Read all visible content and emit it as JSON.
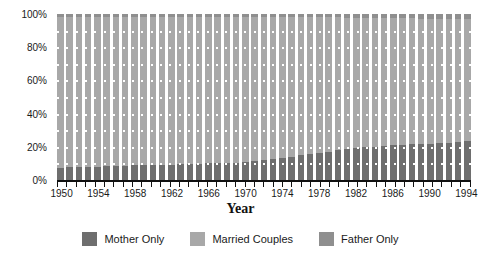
{
  "chart_data": {
    "type": "bar",
    "subtype": "stacked-percentage",
    "title": "",
    "xlabel": "Year",
    "ylabel": "",
    "ylim": [
      0,
      100
    ],
    "ytick_labels": [
      "0%",
      "20%",
      "40%",
      "60%",
      "80%",
      "100%"
    ],
    "ytick_values": [
      0,
      20,
      40,
      60,
      80,
      100
    ],
    "grid": true,
    "grid_style": "white dotted horizontal over bars",
    "legend_position": "bottom-center",
    "categories": [
      1950,
      1951,
      1952,
      1953,
      1954,
      1955,
      1956,
      1957,
      1958,
      1959,
      1960,
      1961,
      1962,
      1963,
      1964,
      1965,
      1966,
      1967,
      1968,
      1969,
      1970,
      1971,
      1972,
      1973,
      1974,
      1975,
      1976,
      1977,
      1978,
      1979,
      1980,
      1981,
      1982,
      1983,
      1984,
      1985,
      1986,
      1987,
      1988,
      1989,
      1990,
      1991,
      1992,
      1993,
      1994
    ],
    "xtick_labels": [
      "1950",
      "1954",
      "1958",
      "1962",
      "1966",
      "1970",
      "1974",
      "1978",
      "1982",
      "1986",
      "1990",
      "1994"
    ],
    "xtick_label_years": [
      1950,
      1954,
      1958,
      1962,
      1966,
      1970,
      1974,
      1978,
      1982,
      1986,
      1990,
      1994
    ],
    "xlim": [
      1950,
      1994
    ],
    "series": [
      {
        "name": "Mother Only",
        "color": "#6e6e6e",
        "values": [
          7.0,
          8.0,
          8.0,
          8.0,
          8.0,
          8.5,
          8.5,
          8.5,
          9.0,
          9.0,
          9.0,
          9.0,
          9.0,
          9.5,
          9.5,
          9.5,
          10.0,
          10.0,
          10.0,
          10.5,
          11.0,
          11.5,
          12.0,
          12.5,
          13.0,
          14.0,
          15.0,
          15.5,
          16.5,
          17.0,
          18.0,
          18.5,
          19.5,
          20.0,
          20.0,
          20.5,
          21.0,
          21.0,
          21.5,
          21.5,
          21.5,
          22.0,
          22.5,
          23.0,
          23.5
        ]
      },
      {
        "name": "Married Couples",
        "color": "#a8a8a8",
        "values": [
          91.0,
          90.0,
          90.0,
          90.0,
          90.0,
          89.5,
          89.5,
          89.5,
          89.0,
          89.0,
          89.0,
          89.0,
          89.0,
          88.5,
          88.5,
          88.5,
          88.0,
          88.0,
          88.0,
          87.5,
          87.0,
          86.5,
          86.0,
          85.5,
          85.0,
          84.0,
          83.0,
          82.5,
          81.5,
          81.0,
          80.0,
          79.0,
          78.0,
          77.5,
          77.5,
          77.0,
          76.5,
          76.5,
          76.0,
          75.5,
          75.5,
          75.0,
          74.5,
          74.0,
          73.5
        ]
      },
      {
        "name": "Father Only",
        "color": "#8f8f8f",
        "values": [
          2.0,
          2.0,
          2.0,
          2.0,
          2.0,
          2.0,
          2.0,
          2.0,
          2.0,
          2.0,
          2.0,
          2.0,
          2.0,
          2.0,
          2.0,
          2.0,
          2.0,
          2.0,
          2.0,
          2.0,
          2.0,
          2.0,
          2.0,
          2.0,
          2.0,
          2.0,
          2.0,
          2.0,
          2.0,
          2.0,
          2.0,
          2.5,
          2.5,
          2.5,
          2.5,
          2.5,
          2.5,
          2.5,
          2.5,
          3.0,
          3.0,
          3.0,
          3.0,
          3.0,
          3.0
        ]
      }
    ]
  },
  "legend": {
    "items": [
      {
        "label": "Mother Only",
        "color": "#6e6e6e"
      },
      {
        "label": "Married Couples",
        "color": "#a8a8a8"
      },
      {
        "label": "Father Only",
        "color": "#8f8f8f"
      }
    ]
  },
  "axis": {
    "x_title": "Year"
  }
}
